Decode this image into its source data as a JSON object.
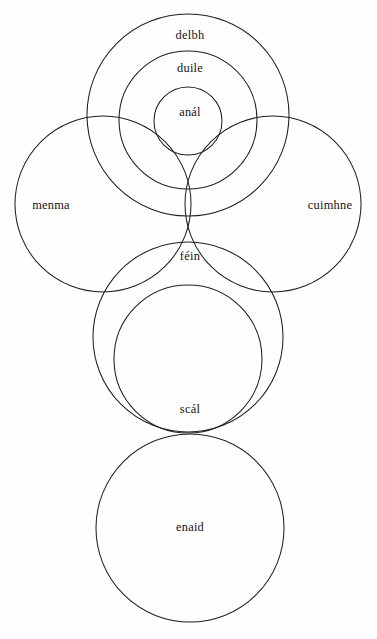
{
  "figure": {
    "background_color": "#fefefe",
    "stroke_color": "#221f1f",
    "text_color": "#141414",
    "width": 377,
    "height": 639
  },
  "diagram": {
    "type": "venn-euler",
    "circles": [
      {
        "id": "delbh",
        "label": "delbh",
        "cx": 188,
        "cy": 115,
        "r": 101,
        "label_x": 190,
        "label_y": 36
      },
      {
        "id": "duile",
        "label": "duile",
        "cx": 188,
        "cy": 120,
        "r": 69,
        "label_x": 190,
        "label_y": 69
      },
      {
        "id": "anal",
        "label": "anál",
        "cx": 188,
        "cy": 121,
        "r": 34,
        "label_x": 190,
        "label_y": 113
      },
      {
        "id": "menma",
        "label": "menma",
        "cx": 103,
        "cy": 204,
        "r": 88,
        "label_x": 51,
        "label_y": 206
      },
      {
        "id": "cuimhne",
        "label": "cuimhne",
        "cx": 273,
        "cy": 204,
        "r": 88,
        "label_x": 330,
        "label_y": 206
      },
      {
        "id": "fein",
        "label": "féin",
        "cx": 188,
        "cy": 337,
        "r": 95,
        "label_x": 190,
        "label_y": 257
      },
      {
        "id": "scal",
        "label": "scál",
        "cx": 188,
        "cy": 359,
        "r": 74,
        "label_x": 190,
        "label_y": 410
      },
      {
        "id": "enaid",
        "label": "enaid",
        "cx": 190,
        "cy": 528,
        "r": 94,
        "label_x": 190,
        "label_y": 528
      }
    ]
  }
}
